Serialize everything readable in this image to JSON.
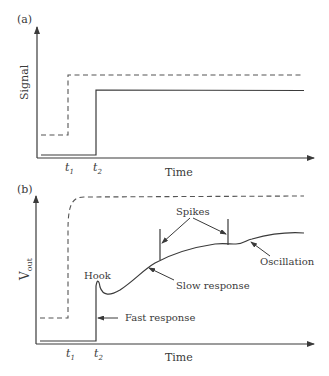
{
  "panel_a": {
    "label": "(a)",
    "y_axis_label": "Signal",
    "x_axis_label": "Time",
    "t1": "t",
    "t1_sub": "1",
    "t2": "t",
    "t2_sub": "2"
  },
  "panel_b": {
    "label": "(b)",
    "y_axis_label": "V",
    "y_axis_sub": "out",
    "x_axis_label": "Time",
    "t1": "t",
    "t1_sub": "1",
    "t2": "t",
    "t2_sub": "2",
    "annotations": {
      "hook": "Hook",
      "fast_response": "Fast response",
      "slow_response": "Slow response",
      "spikes": "Spikes",
      "oscillation": "Oscillation"
    }
  },
  "colors": {
    "line": "#3a3a3a",
    "dashed": "#555555"
  }
}
